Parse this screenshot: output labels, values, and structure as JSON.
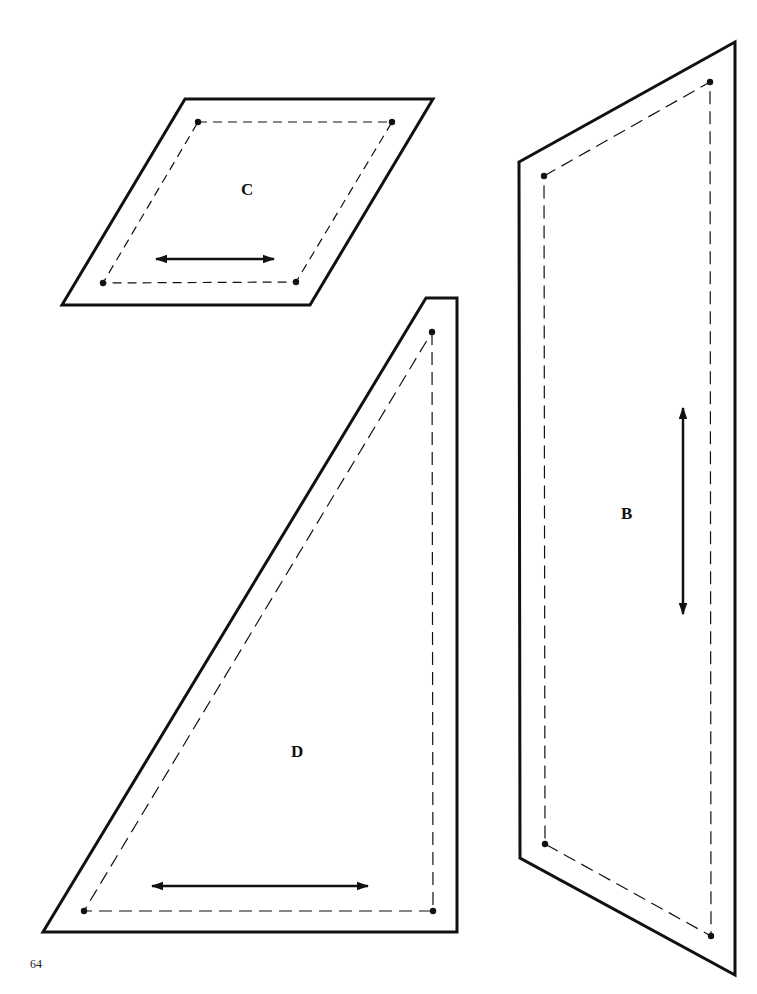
{
  "page": {
    "number": "64",
    "background": "#ffffff",
    "ink": "#111111"
  },
  "pieces": [
    {
      "label": "C",
      "shape": "parallelogram",
      "outline": [
        [
          185,
          99
        ],
        [
          433,
          99
        ],
        [
          310,
          305
        ],
        [
          62,
          305
        ]
      ],
      "seam_points": [
        [
          198,
          122
        ],
        [
          392,
          122
        ],
        [
          296,
          282
        ],
        [
          103,
          283
        ]
      ],
      "grain_arrow": {
        "orientation": "horizontal",
        "from": [
          153,
          259
        ],
        "to": [
          277,
          259
        ]
      },
      "label_pos": [
        241,
        180
      ]
    },
    {
      "label": "B",
      "shape": "quadrilateral",
      "outline": [
        [
          519,
          162
        ],
        [
          735,
          42
        ],
        [
          735,
          975
        ],
        [
          520,
          858
        ]
      ],
      "seam_points": [
        [
          544,
          176
        ],
        [
          710,
          82
        ],
        [
          711,
          936
        ],
        [
          545,
          844
        ]
      ],
      "grain_arrow": {
        "orientation": "vertical",
        "from": [
          683,
          405
        ],
        "to": [
          683,
          617
        ]
      },
      "label_pos": [
        621,
        504
      ]
    },
    {
      "label": "D",
      "shape": "triangle-trapezoid",
      "outline": [
        [
          426,
          298
        ],
        [
          457,
          298
        ],
        [
          457,
          932
        ],
        [
          43,
          932
        ]
      ],
      "seam_points": [
        [
          432,
          332
        ],
        [
          433,
          911
        ],
        [
          84,
          911
        ]
      ],
      "grain_arrow": {
        "orientation": "horizontal",
        "from": [
          149,
          886
        ],
        "to": [
          371,
          886
        ]
      },
      "label_pos": [
        291,
        742
      ]
    }
  ]
}
